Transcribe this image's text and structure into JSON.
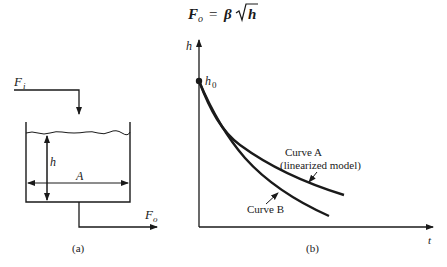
{
  "equation": {
    "lhs": "F",
    "lhs_sub": "o",
    "eq": "=",
    "coef": "β",
    "radicand": "h"
  },
  "panel_a": {
    "inflow_label": "F",
    "inflow_sub": "i",
    "outflow_label": "F",
    "outflow_sub": "o",
    "height_label": "h",
    "area_label": "A",
    "caption": "(a)"
  },
  "panel_b": {
    "y_axis_label": "h",
    "x_axis_label": "t",
    "initial_label": "h",
    "initial_sub": "0",
    "curve_a_line1": "Curve A",
    "curve_a_line2": "(linearized model)",
    "curve_b_label": "Curve B",
    "caption": "(b)"
  },
  "colors": {
    "ink": "#1a1a1a",
    "background": "#ffffff"
  }
}
